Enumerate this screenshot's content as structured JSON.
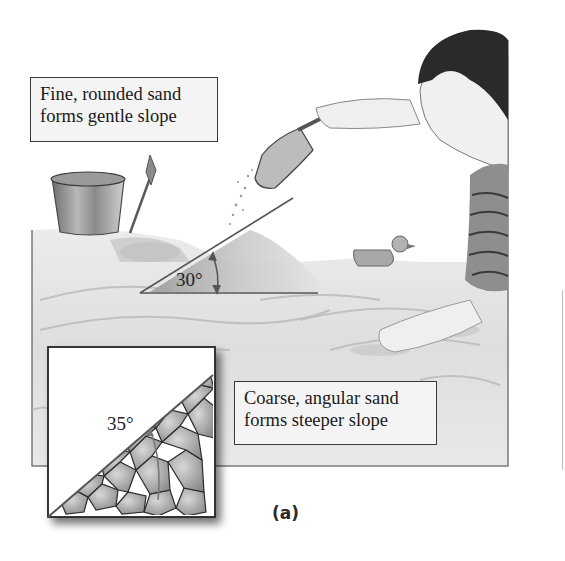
{
  "figure": {
    "caption": "(a)",
    "labels": {
      "fine_sand": {
        "line1": "Fine, rounded sand",
        "line2": "forms gentle slope"
      },
      "coarse_sand": {
        "line1": "Coarse, angular sand",
        "line2": "forms steeper slope"
      }
    },
    "angles": {
      "fine": "30°",
      "coarse": "35°"
    },
    "illustration": {
      "scene": "child pouring sand from scoop onto pile in sandbox",
      "objects": [
        "bucket",
        "shovel",
        "scoop",
        "sand-pile",
        "rubber-duck",
        "child"
      ],
      "inset": "close-up of coarse angular grains at slope"
    },
    "colors": {
      "line": "#555555",
      "box_border": "#3a3a3a",
      "box_fill": "#f4f4f4",
      "sand_light": "#e6e6e6",
      "sand_dark": "#a8a8a8"
    }
  }
}
